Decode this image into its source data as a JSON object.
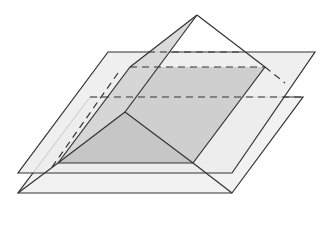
{
  "diagram": {
    "title": "",
    "colors": {
      "background": "#ffffff",
      "plane_fill": "#eeeeee",
      "section_fill": "#cfcfcf",
      "face_fill": "#dcdcdc",
      "stroke": "#333333"
    },
    "elements": [
      {
        "id": "upper-plane",
        "type": "parallelogram"
      },
      {
        "id": "lower-plane",
        "type": "parallelogram"
      },
      {
        "id": "pyramid",
        "type": "pyramid"
      },
      {
        "id": "cross-section",
        "type": "quadrilateral"
      }
    ]
  }
}
